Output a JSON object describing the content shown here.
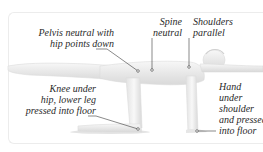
{
  "diagram": {
    "pose": "Bird-dog / quadruped opposite arm-leg reach (side view)",
    "labels": [
      {
        "id": "pelvis",
        "text": "Pelvis neutral with\nhip points down"
      },
      {
        "id": "spine",
        "text": "Spine\nneutral"
      },
      {
        "id": "shoulders",
        "text": "Shoulders\nparallel"
      },
      {
        "id": "knee",
        "text": "Knee under\nhip, lower leg\npressed into floor"
      },
      {
        "id": "hand",
        "text": "Hand\nunder\nshoulder\nand pressed\ninto floor"
      }
    ],
    "colors": {
      "body_fill": "#ededed",
      "body_shade": "#d6d6d6",
      "leader_line": "#3a3a3a",
      "text": "#2a2a2a",
      "frame": "#ececec"
    }
  }
}
